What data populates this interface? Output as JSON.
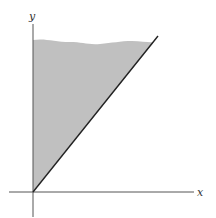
{
  "diagram": {
    "axes": {
      "x_label": "x",
      "y_label": "y"
    },
    "region": {
      "description": "Shaded region between y-axis and line y = x, unbounded above",
      "fill_color": "#bdbdbd",
      "boundary_line_color": "#222222"
    },
    "colors": {
      "axis": "#555555",
      "background": "#ffffff"
    }
  }
}
